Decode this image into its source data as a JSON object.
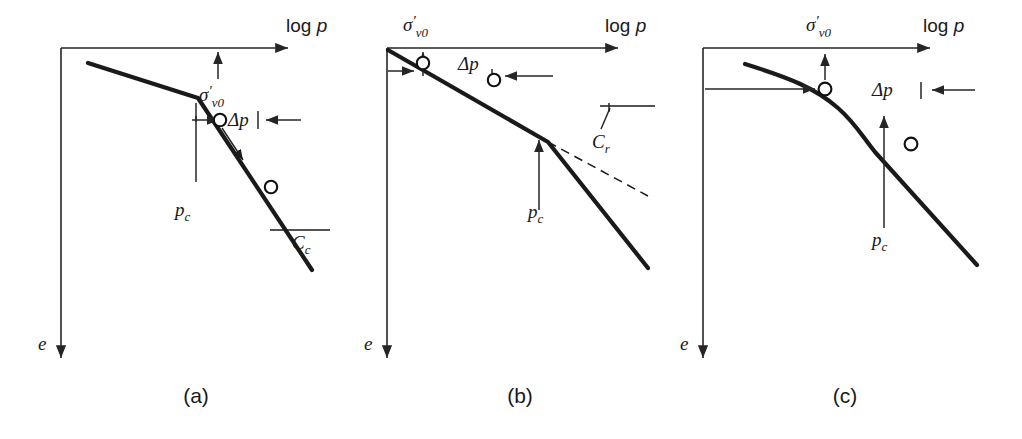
{
  "figure": {
    "type": "technical-diagram",
    "background_color": "#ffffff",
    "curve_color": "#1a1a1a",
    "axis_color": "#262626"
  },
  "axis_labels": {
    "x_prefix": "log",
    "x_variable": "p",
    "y_variable": "e"
  },
  "symbols": {
    "sigma": "σ",
    "prime": "′",
    "sigma_sub": "v0",
    "delta": "Δ",
    "delta_p_variable": "p",
    "pc_variable": "p",
    "pc_sub": "c",
    "cc_variable": "C",
    "cc_sub": "c",
    "cr_variable": "C",
    "cr_sub": "r"
  },
  "panels": [
    {
      "id": "a",
      "caption": "(a)",
      "description": "Normally consolidated clay, sharp break at preconsolidation pressure",
      "labels": {
        "x_axis": "log p",
        "y_axis": "e",
        "sigma_v0": "σ′v0",
        "delta_p": "Δp",
        "p_c": "pc",
        "compression_index": "Cc"
      },
      "markers": 2,
      "has_dashed_extension": false,
      "has_recompression_label": false,
      "has_compression_label": true,
      "curve_shape": "sharp-kink"
    },
    {
      "id": "b",
      "caption": "(b)",
      "description": "Overconsolidated clay, load increment within recompression range",
      "labels": {
        "x_axis": "log p",
        "y_axis": "e",
        "sigma_v0": "σ′v0",
        "delta_p": "Δp",
        "p_c": "pc",
        "recompression_index": "Cr"
      },
      "markers": 2,
      "has_dashed_extension": true,
      "has_recompression_label": true,
      "has_compression_label": false,
      "curve_shape": "sharp-kink"
    },
    {
      "id": "c",
      "caption": "(c)",
      "description": "Overconsolidated clay, load increment crossing preconsolidation pressure",
      "labels": {
        "x_axis": "log p",
        "y_axis": "e",
        "sigma_v0": "σ′v0",
        "delta_p": "Δp",
        "p_c": "pc"
      },
      "markers": 2,
      "has_dashed_extension": false,
      "has_recompression_label": false,
      "has_compression_label": false,
      "curve_shape": "smooth-transition"
    }
  ]
}
